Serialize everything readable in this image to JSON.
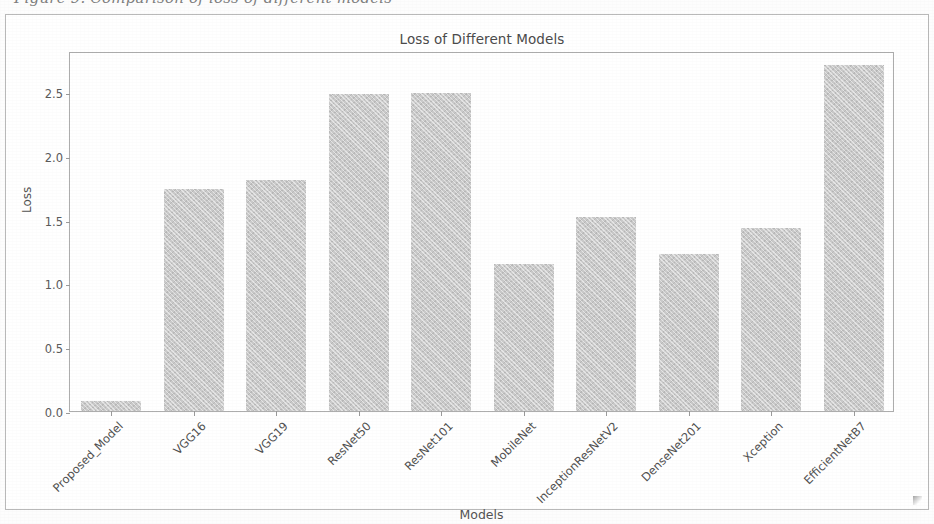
{
  "page": {
    "caption_fragment": "Figure 9. Comparison of loss of different models"
  },
  "figure": {
    "title": "Loss of Different Models",
    "xlabel": "Models",
    "ylabel": "Loss",
    "bar_color": "#cacaca",
    "axis_color": "#adadad"
  },
  "chart_data": {
    "type": "bar",
    "title": "Loss of Different Models",
    "xlabel": "Models",
    "ylabel": "Loss",
    "categories": [
      "Proposed_Model",
      "VGG16",
      "VGG19",
      "ResNet50",
      "ResNet101",
      "MobileNet",
      "InceptionResNetV2",
      "DenseNet201",
      "Xception",
      "EfficientNetB7"
    ],
    "values": [
      0.08,
      1.74,
      1.81,
      2.48,
      2.49,
      1.15,
      1.52,
      1.23,
      1.43,
      2.71
    ],
    "ylim": [
      0.0,
      2.82
    ],
    "yticks": [
      0.0,
      0.5,
      1.0,
      1.5,
      2.0,
      2.5
    ],
    "ytick_labels": [
      "0.0",
      "0.5",
      "1.0",
      "1.5",
      "2.0",
      "2.5"
    ],
    "grid": false,
    "legend": null,
    "series": [
      {
        "name": "Loss",
        "values": [
          0.08,
          1.74,
          1.81,
          2.48,
          2.49,
          1.15,
          1.52,
          1.23,
          1.43,
          2.71
        ]
      }
    ]
  }
}
